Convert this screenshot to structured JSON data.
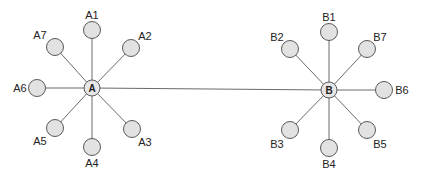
{
  "diagram": {
    "type": "two-star network",
    "colors": {
      "node_fill": "#e2e2e2",
      "stroke": "#5a5a5a",
      "edge": "#6a6a6a",
      "text": "#222222"
    },
    "hubs": [
      {
        "id": "A",
        "label": "A",
        "x": 92,
        "y": 88
      },
      {
        "id": "B",
        "label": "B",
        "x": 329,
        "y": 90
      }
    ],
    "hub_link": {
      "from": "A",
      "to": "B"
    },
    "leaves": [
      {
        "id": "A1",
        "label": "A1",
        "hub": "A",
        "x": 92,
        "y": 30,
        "lx": 92,
        "ly": 19,
        "anchor": "middle"
      },
      {
        "id": "A2",
        "label": "A2",
        "hub": "A",
        "x": 131,
        "y": 48,
        "lx": 145,
        "ly": 40,
        "anchor": "middle"
      },
      {
        "id": "A3",
        "label": "A3",
        "hub": "A",
        "x": 132,
        "y": 129,
        "lx": 145,
        "ly": 146,
        "anchor": "middle"
      },
      {
        "id": "A4",
        "label": "A4",
        "hub": "A",
        "x": 92,
        "y": 147,
        "lx": 92,
        "ly": 167,
        "anchor": "middle"
      },
      {
        "id": "A5",
        "label": "A5",
        "hub": "A",
        "x": 55,
        "y": 128,
        "lx": 40,
        "ly": 145,
        "anchor": "middle"
      },
      {
        "id": "A6",
        "label": "A6",
        "hub": "A",
        "x": 37,
        "y": 88,
        "lx": 20,
        "ly": 92,
        "anchor": "middle"
      },
      {
        "id": "A7",
        "label": "A7",
        "hub": "A",
        "x": 55,
        "y": 47,
        "lx": 40,
        "ly": 39,
        "anchor": "middle"
      },
      {
        "id": "B1",
        "label": "B1",
        "hub": "B",
        "x": 329,
        "y": 32,
        "lx": 329,
        "ly": 21,
        "anchor": "middle"
      },
      {
        "id": "B2",
        "label": "B2",
        "hub": "B",
        "x": 290,
        "y": 49,
        "lx": 277,
        "ly": 41,
        "anchor": "middle"
      },
      {
        "id": "B3",
        "label": "B3",
        "hub": "B",
        "x": 290,
        "y": 130,
        "lx": 277,
        "ly": 148,
        "anchor": "middle"
      },
      {
        "id": "B4",
        "label": "B4",
        "hub": "B",
        "x": 329,
        "y": 148,
        "lx": 329,
        "ly": 168,
        "anchor": "middle"
      },
      {
        "id": "B5",
        "label": "B5",
        "hub": "B",
        "x": 367,
        "y": 130,
        "lx": 380,
        "ly": 148,
        "anchor": "middle"
      },
      {
        "id": "B6",
        "label": "B6",
        "hub": "B",
        "x": 384,
        "y": 90,
        "lx": 402,
        "ly": 94,
        "anchor": "middle"
      },
      {
        "id": "B7",
        "label": "B7",
        "hub": "B",
        "x": 367,
        "y": 49,
        "lx": 380,
        "ly": 41,
        "anchor": "middle"
      }
    ],
    "leaf_radius": 8.5,
    "hub_radius": 8
  }
}
